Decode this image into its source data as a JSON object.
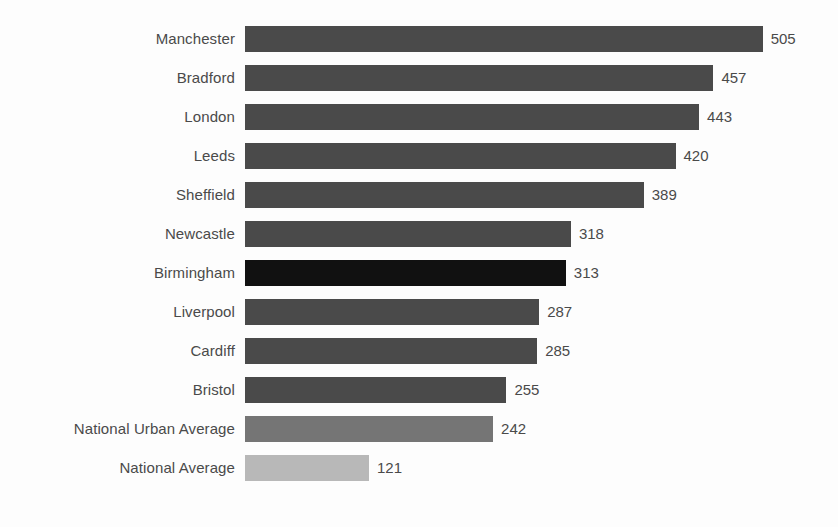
{
  "chart_data": {
    "type": "bar",
    "orientation": "horizontal",
    "title": "",
    "subtitle": "",
    "xlabel": "",
    "ylabel": "",
    "grid": false,
    "legend": "none",
    "xlim": [
      0,
      505
    ],
    "axis_visible": false,
    "tick_labels": [],
    "value_labels_shown": true,
    "categories": [
      "Manchester",
      "Bradford",
      "London",
      "Leeds",
      "Sheffield",
      "Newcastle",
      "Birmingham",
      "Liverpool",
      "Cardiff",
      "Bristol",
      "National Urban Average",
      "National Average"
    ],
    "values": [
      505,
      457,
      443,
      420,
      389,
      318,
      313,
      287,
      285,
      255,
      242,
      121
    ],
    "bar_tones": [
      "dark",
      "dark",
      "dark",
      "dark",
      "dark",
      "dark",
      "highlight",
      "dark",
      "dark",
      "dark",
      "mid",
      "light"
    ],
    "colors": {
      "dark": "#4a4a4a",
      "highlight": "#111111",
      "mid": "#757575",
      "light": "#b8b8b8",
      "background": "#fdfdfd",
      "text": "#4a4a4a"
    },
    "bars": [
      {
        "label": "Manchester",
        "value": 505,
        "tone": "dark"
      },
      {
        "label": "Bradford",
        "value": 457,
        "tone": "dark"
      },
      {
        "label": "London",
        "value": 443,
        "tone": "dark"
      },
      {
        "label": "Leeds",
        "value": 420,
        "tone": "dark"
      },
      {
        "label": "Sheffield",
        "value": 389,
        "tone": "dark"
      },
      {
        "label": "Newcastle",
        "value": 318,
        "tone": "dark"
      },
      {
        "label": "Birmingham",
        "value": 313,
        "tone": "highlight"
      },
      {
        "label": "Liverpool",
        "value": 287,
        "tone": "dark"
      },
      {
        "label": "Cardiff",
        "value": 285,
        "tone": "dark"
      },
      {
        "label": "Bristol",
        "value": 255,
        "tone": "dark"
      },
      {
        "label": "National Urban Average",
        "value": 242,
        "tone": "mid"
      },
      {
        "label": "National Average",
        "value": 121,
        "tone": "light"
      }
    ]
  }
}
